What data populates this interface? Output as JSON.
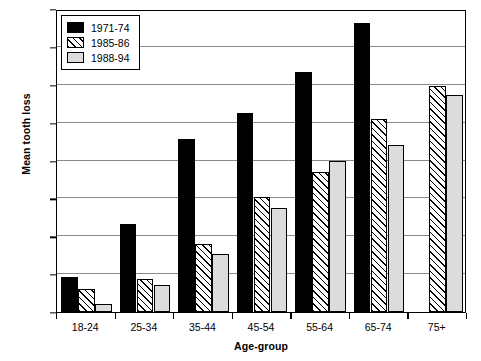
{
  "chart_data": {
    "type": "bar",
    "title": "",
    "xlabel": "Age-group",
    "ylabel": "Mean tooth loss",
    "categories": [
      "18-24",
      "25-34",
      "35-44",
      "45-54",
      "55-64",
      "65-74",
      "75+"
    ],
    "series": [
      {
        "name": "1971-74",
        "values": [
          1.85,
          4.65,
          9.15,
          10.5,
          12.65,
          15.25,
          null
        ]
      },
      {
        "name": "1985-86",
        "values": [
          1.2,
          1.75,
          3.6,
          6.05,
          7.4,
          10.2,
          11.95
        ]
      },
      {
        "name": "1988-94",
        "values": [
          0.4,
          1.45,
          3.05,
          5.5,
          7.95,
          8.8,
          11.45
        ]
      }
    ],
    "ylim": [
      0,
      16
    ],
    "yticks": [
      0,
      2,
      4,
      6,
      8,
      10,
      12,
      14,
      16
    ],
    "ytick_labels": [
      "0",
      "2",
      "4",
      "6",
      "8",
      "10",
      "12",
      "14",
      "16"
    ],
    "grid": true,
    "legend_position": "upper-left",
    "colors": {
      "series_1971_74": "#000000",
      "series_1985_86": "#ffffff",
      "series_1988_94": "#dcdcdc",
      "gridline": "#8a8a8a",
      "axis": "#000000",
      "background": "#ffffff"
    }
  },
  "legend": {
    "items": [
      {
        "label": "1971-74"
      },
      {
        "label": "1985-86"
      },
      {
        "label": "1988-94"
      }
    ]
  }
}
